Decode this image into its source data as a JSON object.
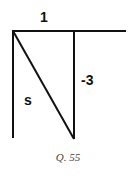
{
  "diagram": {
    "labels": {
      "top": "1",
      "right": "-3",
      "hypotenuse": "s"
    },
    "caption": "Q. 55",
    "stroke_color": "#111111"
  }
}
